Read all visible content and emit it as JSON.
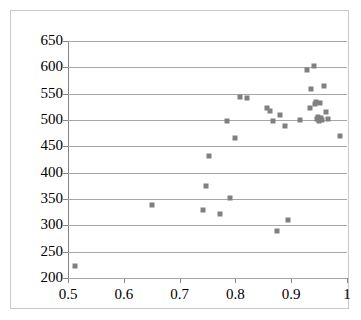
{
  "chart_data": {
    "type": "scatter",
    "title": "",
    "subtitle": "",
    "xlabel": "",
    "ylabel": "",
    "xlim": [
      0.5,
      1.0
    ],
    "ylim": [
      200,
      650
    ],
    "x_ticks": [
      0.5,
      0.6,
      0.7,
      0.8,
      0.9,
      1.0
    ],
    "x_tick_labels": [
      "0.5",
      "0.6",
      "0.7",
      "0.8",
      "0.9",
      "1"
    ],
    "y_ticks": [
      200,
      250,
      300,
      350,
      400,
      450,
      500,
      550,
      600,
      650
    ],
    "y_tick_labels": [
      "200",
      "250",
      "300",
      "350",
      "400",
      "450",
      "500",
      "550",
      "600",
      "650"
    ],
    "grid": true,
    "grid_axis": "y",
    "legend": false,
    "legend_position": "none",
    "marker": "square",
    "marker_color": "#808080",
    "marker_size": 5,
    "series": [
      {
        "name": "series-1",
        "points": [
          [
            0.512,
            222
          ],
          [
            0.65,
            338
          ],
          [
            0.742,
            329
          ],
          [
            0.748,
            375
          ],
          [
            0.752,
            432
          ],
          [
            0.772,
            322
          ],
          [
            0.785,
            498
          ],
          [
            0.79,
            352
          ],
          [
            0.8,
            466
          ],
          [
            0.808,
            543
          ],
          [
            0.82,
            541
          ],
          [
            0.856,
            522
          ],
          [
            0.862,
            518
          ],
          [
            0.868,
            499
          ],
          [
            0.875,
            290
          ],
          [
            0.88,
            509
          ],
          [
            0.888,
            489
          ],
          [
            0.895,
            311
          ],
          [
            0.915,
            500
          ],
          [
            0.928,
            595
          ],
          [
            0.933,
            522
          ],
          [
            0.936,
            558
          ],
          [
            0.94,
            603
          ],
          [
            0.942,
            530
          ],
          [
            0.945,
            535
          ],
          [
            0.946,
            502
          ],
          [
            0.948,
            506
          ],
          [
            0.95,
            498
          ],
          [
            0.952,
            533
          ],
          [
            0.954,
            504
          ],
          [
            0.956,
            500
          ],
          [
            0.958,
            565
          ],
          [
            0.962,
            516
          ],
          [
            0.966,
            502
          ],
          [
            0.988,
            470
          ]
        ]
      }
    ]
  }
}
